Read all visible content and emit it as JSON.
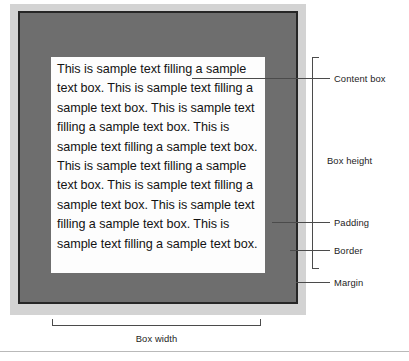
{
  "figure": {
    "content_text": "This is sample text filling a sample text box. This is sample text filling a sample text box. This is sample text filling a sample text box. This is sample text filling a sample text box. This is sample text filling a sample text box. This is sample text filling a sample text box. This is sample text filling a sample text box. This is sample text filling a sample text box."
  },
  "annotations": {
    "content_box": "Content box",
    "box_height": "Box height",
    "padding": "Padding",
    "border": "Border",
    "margin": "Margin",
    "box_width": "Box width"
  },
  "colors": {
    "content_fill": "#fdfdfd",
    "padding_fill": "#6e6e6e",
    "border_stroke": "#262626",
    "margin_fill": "#d3d3d3",
    "text": "#131313",
    "leader_line": "#4b4b4b",
    "footer_rule": "#b9b9b9"
  }
}
